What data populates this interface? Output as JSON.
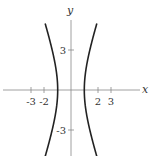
{
  "chart_data": {
    "type": "line",
    "title": "",
    "xlabel": "x",
    "ylabel": "y",
    "equation": "x^2 - y^2/9 = 1",
    "xlim": [
      -5,
      5.5
    ],
    "ylim": [
      -5,
      5
    ],
    "x_ticks": [
      -3,
      -2,
      2,
      3
    ],
    "x_tick_labels": [
      "-3",
      "-2",
      "2",
      "3"
    ],
    "y_ticks": [
      3,
      -3
    ],
    "y_tick_labels": [
      "3",
      "-3"
    ],
    "grid": false,
    "series": [
      {
        "name": "right branch",
        "points": [
          [
            1.95,
            5
          ],
          [
            1.67,
            4
          ],
          [
            1.41,
            3
          ],
          [
            1.2,
            2
          ],
          [
            1.05,
            1
          ],
          [
            1,
            0
          ],
          [
            1.05,
            -1
          ],
          [
            1.2,
            -2
          ],
          [
            1.41,
            -3
          ],
          [
            1.67,
            -4
          ],
          [
            1.95,
            -5
          ]
        ]
      },
      {
        "name": "left branch",
        "points": [
          [
            -1.95,
            5
          ],
          [
            -1.67,
            4
          ],
          [
            -1.41,
            3
          ],
          [
            -1.2,
            2
          ],
          [
            -1.05,
            1
          ],
          [
            -1,
            0
          ],
          [
            -1.05,
            -1
          ],
          [
            -1.2,
            -2
          ],
          [
            -1.41,
            -3
          ],
          [
            -1.67,
            -4
          ],
          [
            -1.95,
            -5
          ]
        ]
      }
    ],
    "color": "#222222"
  }
}
